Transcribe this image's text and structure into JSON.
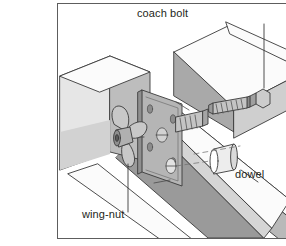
{
  "page": {
    "background_color": "#ffffff",
    "text_color": "#231f20"
  },
  "body_text": {
    "note": "Left-margin paragraph text, clipped by the page edge; only trailing fragments visible",
    "block1_lines": [
      "d (but",
      "base is",
      "ted parts"
    ],
    "block2_lines": [
      "sonable.",
      "d",
      "s can be",
      "low",
      "ce while"
    ],
    "block3_lines": [
      "sitively",
      "nal",
      "wn"
    ]
  },
  "figure": {
    "frame_color": "#5d5d5d",
    "fill_light": "#f2f2f2",
    "fill_mid": "#b9b9b9",
    "fill_dark": "#9a9a9a",
    "fill_white": "#fbfbfb",
    "line_color": "#3a3a3a",
    "labels": {
      "coach_bolt": "coach bolt",
      "dowel": "dowel",
      "wing_nut": "wing-nut"
    },
    "parts": {
      "coach_bolt": "coach-bolt",
      "dowel": "dowel",
      "wing_nut": "wing-nut",
      "metal_plate": "metal-mending-plate",
      "timber_rail": "timber-rail",
      "timber_post": "timber-post",
      "second_bolt": "second-coach-bolt"
    }
  }
}
